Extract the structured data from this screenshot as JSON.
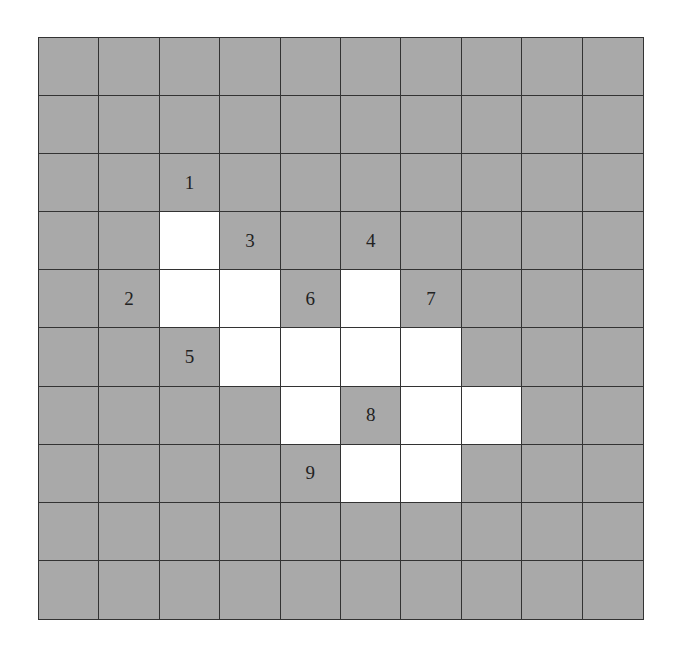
{
  "puzzle": {
    "rows": 10,
    "cols": 10,
    "colors": {
      "blocked": "#a9a9a9",
      "open": "#ffffff",
      "line": "#333333"
    },
    "open_cells": [
      [
        3,
        2
      ],
      [
        4,
        2
      ],
      [
        4,
        3
      ],
      [
        4,
        5
      ],
      [
        5,
        3
      ],
      [
        5,
        4
      ],
      [
        5,
        5
      ],
      [
        5,
        6
      ],
      [
        6,
        4
      ],
      [
        6,
        6
      ],
      [
        6,
        7
      ],
      [
        7,
        5
      ],
      [
        7,
        6
      ]
    ],
    "clues": [
      {
        "label": "1",
        "row": 2,
        "col": 2
      },
      {
        "label": "2",
        "row": 4,
        "col": 1
      },
      {
        "label": "3",
        "row": 3,
        "col": 3
      },
      {
        "label": "4",
        "row": 3,
        "col": 5
      },
      {
        "label": "5",
        "row": 5,
        "col": 2
      },
      {
        "label": "6",
        "row": 4,
        "col": 4
      },
      {
        "label": "7",
        "row": 4,
        "col": 6
      },
      {
        "label": "8",
        "row": 6,
        "col": 5
      },
      {
        "label": "9",
        "row": 7,
        "col": 4
      }
    ]
  }
}
